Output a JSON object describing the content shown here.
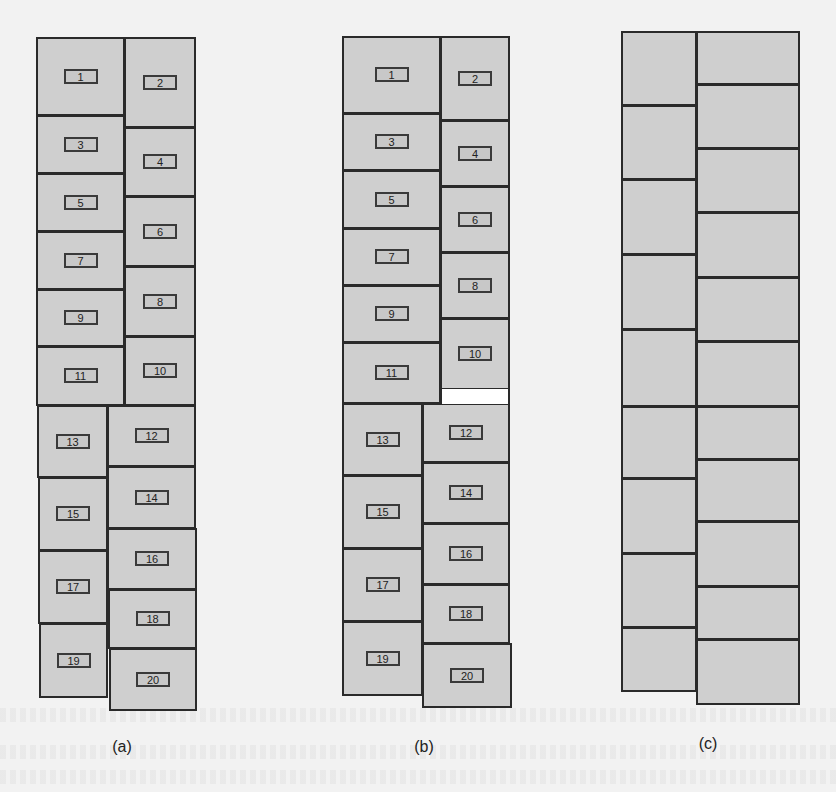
{
  "figure": {
    "captions": {
      "a": "(a)",
      "b": "(b)",
      "c": "(c)"
    },
    "fill_color": "#cfcfcf",
    "border_color": "#2a2a2a",
    "background_color": "#f2f2f2"
  },
  "diagram_a": {
    "caption": "(a)",
    "blocks": [
      {
        "id": "1",
        "x": 36,
        "y": 37,
        "w": 89,
        "h": 79
      },
      {
        "id": "2",
        "x": 124,
        "y": 37,
        "w": 72,
        "h": 91
      },
      {
        "id": "3",
        "x": 36,
        "y": 115,
        "w": 89,
        "h": 59
      },
      {
        "id": "4",
        "x": 124,
        "y": 127,
        "w": 72,
        "h": 70
      },
      {
        "id": "5",
        "x": 36,
        "y": 173,
        "w": 89,
        "h": 59
      },
      {
        "id": "6",
        "x": 124,
        "y": 196,
        "w": 72,
        "h": 71
      },
      {
        "id": "7",
        "x": 36,
        "y": 231,
        "w": 89,
        "h": 59
      },
      {
        "id": "8",
        "x": 124,
        "y": 266,
        "w": 72,
        "h": 71
      },
      {
        "id": "9",
        "x": 36,
        "y": 289,
        "w": 89,
        "h": 58
      },
      {
        "id": "10",
        "x": 124,
        "y": 336,
        "w": 72,
        "h": 70
      },
      {
        "id": "11",
        "x": 36,
        "y": 346,
        "w": 89,
        "h": 60
      },
      {
        "id": "13",
        "x": 37,
        "y": 405,
        "w": 71,
        "h": 73
      },
      {
        "id": "12",
        "x": 107,
        "y": 405,
        "w": 89,
        "h": 62
      },
      {
        "id": "15",
        "x": 38,
        "y": 477,
        "w": 70,
        "h": 74
      },
      {
        "id": "14",
        "x": 107,
        "y": 466,
        "w": 89,
        "h": 63
      },
      {
        "id": "16",
        "x": 107,
        "y": 528,
        "w": 90,
        "h": 62
      },
      {
        "id": "17",
        "x": 38,
        "y": 550,
        "w": 70,
        "h": 74
      },
      {
        "id": "18",
        "x": 108,
        "y": 589,
        "w": 89,
        "h": 60
      },
      {
        "id": "19",
        "x": 39,
        "y": 623,
        "w": 69,
        "h": 75
      },
      {
        "id": "20",
        "x": 109,
        "y": 648,
        "w": 88,
        "h": 63
      }
    ]
  },
  "diagram_b": {
    "caption": "(b)",
    "blocks": [
      {
        "id": "1",
        "x": 342,
        "y": 36,
        "w": 99,
        "h": 78
      },
      {
        "id": "2",
        "x": 440,
        "y": 36,
        "w": 70,
        "h": 85
      },
      {
        "id": "3",
        "x": 342,
        "y": 113,
        "w": 99,
        "h": 58
      },
      {
        "id": "4",
        "x": 440,
        "y": 120,
        "w": 70,
        "h": 67
      },
      {
        "id": "5",
        "x": 342,
        "y": 170,
        "w": 99,
        "h": 59
      },
      {
        "id": "6",
        "x": 440,
        "y": 186,
        "w": 70,
        "h": 67
      },
      {
        "id": "7",
        "x": 342,
        "y": 228,
        "w": 99,
        "h": 58
      },
      {
        "id": "8",
        "x": 440,
        "y": 252,
        "w": 70,
        "h": 67
      },
      {
        "id": "9",
        "x": 342,
        "y": 285,
        "w": 99,
        "h": 58
      },
      {
        "id": "10",
        "x": 440,
        "y": 318,
        "w": 70,
        "h": 72
      },
      {
        "id": "11",
        "x": 342,
        "y": 342,
        "w": 99,
        "h": 62
      },
      {
        "id": "13",
        "x": 342,
        "y": 403,
        "w": 81,
        "h": 73
      },
      {
        "id": "12",
        "x": 422,
        "y": 403,
        "w": 88,
        "h": 60
      },
      {
        "id": "15",
        "x": 342,
        "y": 475,
        "w": 81,
        "h": 74
      },
      {
        "id": "14",
        "x": 422,
        "y": 462,
        "w": 88,
        "h": 62
      },
      {
        "id": "16",
        "x": 422,
        "y": 523,
        "w": 88,
        "h": 62
      },
      {
        "id": "17",
        "x": 342,
        "y": 548,
        "w": 81,
        "h": 74
      },
      {
        "id": "18",
        "x": 422,
        "y": 584,
        "w": 88,
        "h": 60
      },
      {
        "id": "19",
        "x": 342,
        "y": 621,
        "w": 81,
        "h": 75
      },
      {
        "id": "20",
        "x": 422,
        "y": 643,
        "w": 90,
        "h": 65
      }
    ],
    "gap": {
      "x": 440,
      "y": 389,
      "w": 70,
      "h": 15
    }
  },
  "diagram_c": {
    "caption": "(c)",
    "blocks": [
      {
        "x": 621,
        "y": 31,
        "w": 76,
        "h": 75
      },
      {
        "x": 696,
        "y": 31,
        "w": 104,
        "h": 54
      },
      {
        "x": 621,
        "y": 105,
        "w": 76,
        "h": 75
      },
      {
        "x": 696,
        "y": 84,
        "w": 104,
        "h": 65
      },
      {
        "x": 621,
        "y": 179,
        "w": 76,
        "h": 76
      },
      {
        "x": 696,
        "y": 148,
        "w": 104,
        "h": 65
      },
      {
        "x": 621,
        "y": 254,
        "w": 76,
        "h": 76
      },
      {
        "x": 696,
        "y": 212,
        "w": 104,
        "h": 66
      },
      {
        "x": 621,
        "y": 329,
        "w": 76,
        "h": 78
      },
      {
        "x": 696,
        "y": 277,
        "w": 104,
        "h": 65
      },
      {
        "x": 621,
        "y": 406,
        "w": 76,
        "h": 73
      },
      {
        "x": 696,
        "y": 341,
        "w": 104,
        "h": 66
      },
      {
        "x": 621,
        "y": 478,
        "w": 76,
        "h": 76
      },
      {
        "x": 696,
        "y": 406,
        "w": 104,
        "h": 54
      },
      {
        "x": 621,
        "y": 553,
        "w": 76,
        "h": 75
      },
      {
        "x": 696,
        "y": 459,
        "w": 104,
        "h": 63
      },
      {
        "x": 621,
        "y": 627,
        "w": 76,
        "h": 65
      },
      {
        "x": 696,
        "y": 521,
        "w": 104,
        "h": 66
      },
      {
        "x": 696,
        "y": 586,
        "w": 104,
        "h": 54
      },
      {
        "x": 696,
        "y": 639,
        "w": 104,
        "h": 66
      }
    ]
  }
}
